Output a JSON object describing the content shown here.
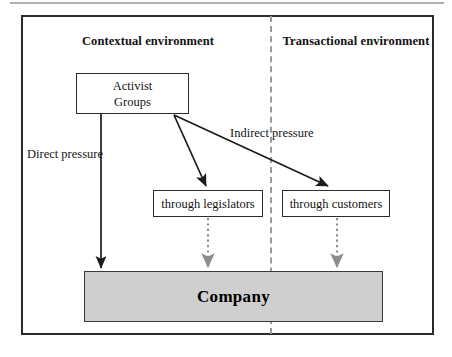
{
  "figure": {
    "title_rule": "top-divider",
    "environments": {
      "left_label": "Contextual environment",
      "right_label": "Transactional environment"
    },
    "nodes": {
      "activist": "Activist\nGroups",
      "activist_line_1": "Activist",
      "activist_line_2": "Groups",
      "legislators": "through legislators",
      "customers": "through customers",
      "company": "Company"
    },
    "edge_labels": {
      "direct": "Direct pressure",
      "indirect": "Indirect pressure"
    },
    "colors": {
      "frame": "#2b2b2b",
      "divider": "#9a9a9a",
      "company_fill": "#cfcfcf",
      "text": "#141414",
      "top_rule": "#b0b0b0"
    },
    "edges": [
      {
        "name": "activist-to-company",
        "from": "activist",
        "to": "company",
        "style": "solid",
        "label": "Direct pressure"
      },
      {
        "name": "activist-to-legislators",
        "from": "activist",
        "to": "legislators",
        "style": "solid",
        "label": ""
      },
      {
        "name": "activist-to-customers",
        "from": "activist",
        "to": "customers",
        "style": "solid",
        "label": "Indirect pressure"
      },
      {
        "name": "legislators-to-company",
        "from": "legislators",
        "to": "company",
        "style": "dotted",
        "label": ""
      },
      {
        "name": "customers-to-company",
        "from": "customers",
        "to": "company",
        "style": "dotted",
        "label": ""
      }
    ]
  }
}
